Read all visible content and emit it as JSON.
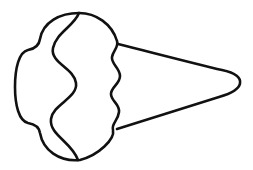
{
  "image": {
    "kind": "line-drawing",
    "subject": "ice-cream-cone",
    "orientation": "horizontal",
    "title": "Ice cream cone outline drawing",
    "style": "coloring-book black outline on white",
    "width": 253,
    "height": 170,
    "background_color": "#ffffff",
    "stroke_color": "#111111",
    "fill_color": "#ffffff",
    "stroke_width_px": 2.6,
    "text_content": "",
    "labels": []
  },
  "shapes": {
    "cone": {
      "name": "cone",
      "description": "Triangular waffle cone with rounded tip pointing right",
      "attach_top": {
        "x": 118,
        "y": 44
      },
      "attach_bottom": {
        "x": 117,
        "y": 129
      },
      "tip": {
        "x": 240,
        "y": 83
      },
      "path": "M 118 44 C 150 52 196 64 222 70 C 236 73 241 78 240 83.5 C 239 89 233 93 219 97 C 193 105 146 120 117 129"
    },
    "scoop": {
      "name": "scoop",
      "description": "Bumpy lobed ice cream scoop on the left side",
      "top_apex": {
        "x": 79,
        "y": 13
      },
      "bottom_apex": {
        "x": 78,
        "y": 160
      },
      "leftmost": {
        "x": 15,
        "y": 85
      },
      "rightmost": {
        "x": 120,
        "y": 86
      },
      "path": "M 79 13 C 96 13 112 24 117 41 C 119 47 113 51 112 57 C 111 64 120 68 120 76 C 120 84 111 87 111 94 C 111 101 120 104 119 112 C 118 121 111 124 113 130 C 115 139 99 155 80 160 C 59 162 43 150 40 133 C 39 126 34 124 28 123 C 19 121 15 105 15 87 C 15 68 19 52 28 50 C 34 49 39 46 40 39 C 43 22 60 13 79 13 Z"
    },
    "swirl": {
      "name": "swirl-line",
      "description": "Inner S-curve swirl line separating the scoop lobes",
      "start": {
        "x": 79,
        "y": 13
      },
      "end": {
        "x": 78,
        "y": 160
      },
      "path": "M 79 13 C 74 26 56 33 53 48 C 50 63 74 68 76 83 C 78 98 53 104 51 119 C 49 135 72 142 78 160"
    }
  }
}
